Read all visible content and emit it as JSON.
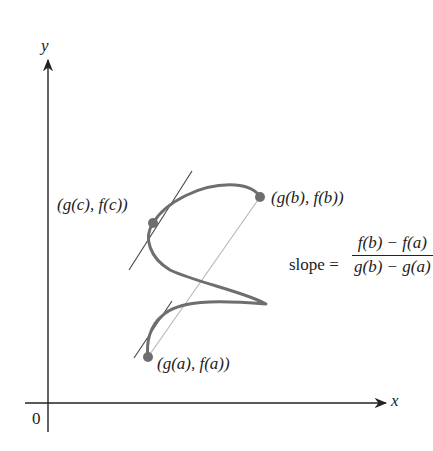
{
  "figure": {
    "axes": {
      "x_label": "x",
      "y_label": "y",
      "origin_label": "0"
    },
    "points": {
      "a": {
        "label": "(g(a), f(a))"
      },
      "b": {
        "label": "(g(b), f(b))"
      },
      "c": {
        "label": "(g(c), f(c))"
      }
    },
    "slope": {
      "prefix": "slope =",
      "numerator": "f(b) − f(a)",
      "denominator": "g(b) − g(a)"
    },
    "colors": {
      "curve": "#6e6e6e",
      "points": "#6e6e6e",
      "axes": "#222222",
      "tangent_lines": "#444444",
      "secant_line": "#b5b5b5",
      "text": "#222222"
    }
  }
}
